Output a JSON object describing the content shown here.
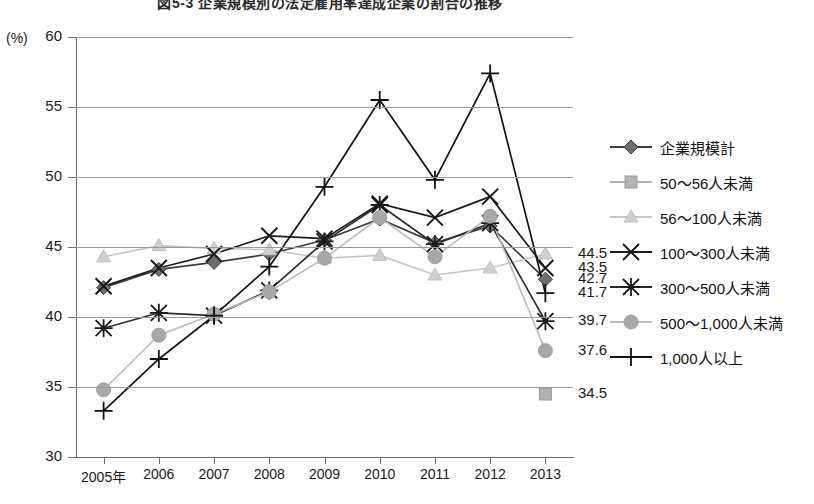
{
  "chart_data": {
    "type": "line",
    "title": "図5-3 企業規模別の法定雇用率達成企業の割合の推移",
    "unit_label": "(%)",
    "xlabel": "",
    "ylabel": "",
    "grid": true,
    "legend_position": "right",
    "ylim": [
      30,
      60
    ],
    "yticks": [
      30,
      35,
      40,
      45,
      50,
      55,
      60
    ],
    "categories": [
      "2005年",
      "2006",
      "2007",
      "2008",
      "2009",
      "2010",
      "2011",
      "2012",
      "2013"
    ],
    "series": [
      {
        "name": "企業規模計",
        "marker": "diamond",
        "color": "#6f6f6f",
        "line_color": "#3d3d3d",
        "values": [
          42.1,
          43.4,
          43.9,
          44.5,
          45.5,
          47.0,
          45.3,
          46.5,
          42.7
        ],
        "end_label": "42.7"
      },
      {
        "name": "50～56人未満",
        "marker": "square",
        "color": "#b3b3b3",
        "line_color": "#b3b3b3",
        "values": [
          null,
          null,
          null,
          null,
          null,
          null,
          null,
          null,
          34.5
        ],
        "end_label": "34.5"
      },
      {
        "name": "56～100人未満",
        "marker": "triangle",
        "color": "#cfcfcf",
        "line_color": "#c6c6c6",
        "values": [
          44.3,
          45.1,
          44.9,
          44.8,
          44.2,
          44.4,
          43.0,
          43.5,
          44.5
        ],
        "end_label": "44.5"
      },
      {
        "name": "100～300人未満",
        "marker": "x",
        "color": "#1a1a1a",
        "line_color": "#1a1a1a",
        "values": [
          42.2,
          43.5,
          44.5,
          45.8,
          45.6,
          48.1,
          47.1,
          48.6,
          43.5
        ],
        "end_label": "43.5"
      },
      {
        "name": "300～500人未満",
        "marker": "asterisk",
        "color": "#1a1a1a",
        "line_color": "#2b2b2b",
        "values": [
          39.2,
          40.3,
          40.1,
          41.9,
          45.4,
          48.0,
          45.2,
          46.7,
          39.7
        ],
        "end_label": "39.7"
      },
      {
        "name": "500～1,000人未満",
        "marker": "circle",
        "color": "#a8a8a8",
        "line_color": "#bdbdbd",
        "values": [
          34.8,
          38.7,
          40.2,
          41.8,
          44.2,
          47.1,
          44.3,
          47.2,
          37.6
        ],
        "end_label": "37.6"
      },
      {
        "name": "1,000人以上",
        "marker": "plus",
        "color": "#111111",
        "line_color": "#111111",
        "values": [
          33.3,
          37.0,
          40.1,
          43.6,
          49.3,
          55.5,
          49.8,
          57.4,
          41.7
        ],
        "end_label": "41.7"
      }
    ],
    "end_labels": [
      {
        "text": "44.5",
        "value": 44.5
      },
      {
        "text": "43.5",
        "value": 43.5
      },
      {
        "text": "42.7",
        "value": 42.7
      },
      {
        "text": "41.7",
        "value": 41.7
      },
      {
        "text": "39.7",
        "value": 39.7
      },
      {
        "text": "37.6",
        "value": 37.6
      },
      {
        "text": "34.5",
        "value": 34.5
      }
    ]
  }
}
